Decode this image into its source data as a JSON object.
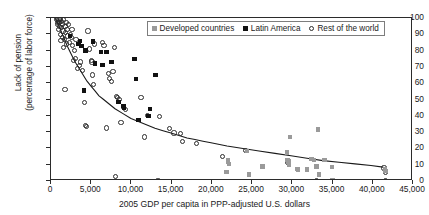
{
  "chart_data": {
    "type": "scatter",
    "title": "",
    "xlabel": "2005 GDP per capita in PPP-adjusted U.S. dollars",
    "ylabel_line1": "Lack of pension",
    "ylabel_line2": "(percentage of labor force)",
    "xlim": [
      0,
      45000
    ],
    "ylim": [
      0,
      100
    ],
    "xticks": [
      0,
      5000,
      10000,
      15000,
      20000,
      25000,
      30000,
      35000,
      40000,
      45000
    ],
    "xtick_labels": [
      "0",
      "5,000",
      "10,000",
      "15,000",
      "20,000",
      "25,000",
      "30,000",
      "35,000",
      "40,000",
      "45,000"
    ],
    "yticks": [
      0,
      10,
      20,
      30,
      40,
      50,
      60,
      70,
      80,
      90,
      100
    ],
    "ytick_labels": [
      "0",
      "10",
      "20",
      "30",
      "40",
      "50",
      "60",
      "70",
      "80",
      "90",
      "100"
    ],
    "grid": false,
    "legend_position": "top-center",
    "colors": {
      "developed": "#9a9a9a",
      "latin_america": "#111111",
      "rest_of_world": "#2b2b2b",
      "trendline": "#1a1a1a",
      "axis": "#2b2b2b"
    },
    "legend": [
      {
        "label": "Developed countries",
        "marker": "filled-square",
        "color": "#9a9a9a"
      },
      {
        "label": "Latin America",
        "marker": "filled-square",
        "color": "#111111"
      },
      {
        "label": "Rest of the world",
        "marker": "open-circle",
        "color": "#2b2b2b"
      }
    ],
    "series": [
      {
        "name": "Rest of the world",
        "marker": "open-circle",
        "points": [
          [
            700,
            99
          ],
          [
            800,
            97
          ],
          [
            850,
            96
          ],
          [
            900,
            98
          ],
          [
            950,
            93
          ],
          [
            1000,
            99
          ],
          [
            1050,
            95
          ],
          [
            1100,
            97
          ],
          [
            1150,
            90
          ],
          [
            1200,
            99
          ],
          [
            1250,
            86
          ],
          [
            1300,
            94
          ],
          [
            1350,
            98
          ],
          [
            1400,
            88
          ],
          [
            1450,
            96
          ],
          [
            1500,
            92
          ],
          [
            1550,
            82
          ],
          [
            1600,
            99
          ],
          [
            1700,
            87
          ],
          [
            1750,
            95
          ],
          [
            1800,
            91
          ],
          [
            1900,
            84
          ],
          [
            1950,
            97
          ],
          [
            2000,
            93
          ],
          [
            2100,
            89
          ],
          [
            2200,
            96
          ],
          [
            2300,
            85
          ],
          [
            2400,
            90
          ],
          [
            2500,
            88
          ],
          [
            2600,
            93
          ],
          [
            1750,
            56
          ],
          [
            2700,
            83
          ],
          [
            2800,
            74
          ],
          [
            2900,
            80
          ],
          [
            3000,
            75
          ],
          [
            3100,
            87
          ],
          [
            3300,
            69
          ],
          [
            3500,
            71
          ],
          [
            3700,
            73
          ],
          [
            3900,
            68
          ],
          [
            4200,
            48
          ],
          [
            4300,
            34
          ],
          [
            4400,
            33.5
          ],
          [
            4600,
            92
          ],
          [
            4800,
            81
          ],
          [
            5000,
            74
          ],
          [
            5100,
            73
          ],
          [
            5200,
            65
          ],
          [
            5300,
            59
          ],
          [
            5400,
            84
          ],
          [
            6400,
            85
          ],
          [
            6600,
            83
          ],
          [
            6900,
            32.5
          ],
          [
            7100,
            66
          ],
          [
            7300,
            63
          ],
          [
            7500,
            61
          ],
          [
            7700,
            67
          ],
          [
            7900,
            82
          ],
          [
            8000,
            3
          ],
          [
            8100,
            52
          ],
          [
            8300,
            51
          ],
          [
            8500,
            50
          ],
          [
            8700,
            36
          ],
          [
            9000,
            45
          ],
          [
            9300,
            44
          ],
          [
            11200,
            51
          ],
          [
            11600,
            27
          ],
          [
            12000,
            40
          ],
          [
            13300,
            0
          ],
          [
            13500,
            39.5
          ],
          [
            14700,
            32
          ],
          [
            15300,
            29.5
          ],
          [
            16100,
            29
          ],
          [
            16300,
            24
          ],
          [
            18100,
            23
          ],
          [
            21300,
            15
          ],
          [
            24200,
            18.5
          ],
          [
            29400,
            11.5
          ],
          [
            33000,
            0
          ],
          [
            41400,
            8
          ],
          [
            41600,
            5
          ],
          [
            41600,
            0.5
          ]
        ]
      },
      {
        "name": "Latin America",
        "marker": "filled-square",
        "points": [
          [
            2400,
            89
          ],
          [
            3400,
            84
          ],
          [
            3600,
            86
          ],
          [
            3800,
            83
          ],
          [
            4100,
            55.5
          ],
          [
            4300,
            80
          ],
          [
            5200,
            85.5
          ],
          [
            5500,
            72
          ],
          [
            6200,
            79
          ],
          [
            6400,
            71
          ],
          [
            6900,
            79
          ],
          [
            7500,
            73
          ],
          [
            8400,
            48.5
          ],
          [
            9000,
            46
          ],
          [
            9100,
            45
          ],
          [
            10400,
            75
          ],
          [
            10600,
            62.5
          ],
          [
            10900,
            37.5
          ],
          [
            12300,
            44
          ],
          [
            13000,
            65
          ],
          [
            12100,
            40
          ]
        ]
      },
      {
        "name": "Developed countries",
        "marker": "filled-square",
        "points": [
          [
            21800,
            5.5
          ],
          [
            22000,
            13
          ],
          [
            22000,
            11.5
          ],
          [
            22100,
            10.5
          ],
          [
            24400,
            18.5
          ],
          [
            24600,
            4
          ],
          [
            26300,
            9
          ],
          [
            29300,
            17.5
          ],
          [
            29400,
            13
          ],
          [
            29500,
            12
          ],
          [
            29600,
            10
          ],
          [
            29700,
            27
          ],
          [
            30600,
            7.5
          ],
          [
            30700,
            7
          ],
          [
            31800,
            7
          ],
          [
            32400,
            13.5
          ],
          [
            32700,
            13
          ],
          [
            33000,
            9
          ],
          [
            33200,
            31.5
          ],
          [
            33300,
            4
          ],
          [
            34000,
            13
          ],
          [
            34900,
            8.5
          ],
          [
            35000,
            0.5
          ],
          [
            41500,
            7.5
          ],
          [
            41600,
            6
          ]
        ]
      }
    ],
    "trendline": {
      "description": "decaying power/exponential fit from ~100% at low GDP to ~8% at 41,500",
      "points": [
        [
          500,
          100
        ],
        [
          1000,
          95
        ],
        [
          1500,
          89
        ],
        [
          2000,
          83
        ],
        [
          2500,
          78
        ],
        [
          3000,
          73
        ],
        [
          3500,
          69
        ],
        [
          4000,
          65
        ],
        [
          4500,
          61
        ],
        [
          5000,
          58
        ],
        [
          5500,
          55
        ],
        [
          6000,
          52
        ],
        [
          6500,
          50
        ],
        [
          7000,
          48
        ],
        [
          7500,
          46
        ],
        [
          8000,
          44
        ],
        [
          9000,
          41
        ],
        [
          10000,
          38
        ],
        [
          11000,
          36
        ],
        [
          12000,
          34
        ],
        [
          13000,
          32
        ],
        [
          14000,
          30.5
        ],
        [
          15000,
          29
        ],
        [
          16000,
          27.5
        ],
        [
          17000,
          26
        ],
        [
          18000,
          25
        ],
        [
          19000,
          24
        ],
        [
          20000,
          23
        ],
        [
          22000,
          21
        ],
        [
          24000,
          19.5
        ],
        [
          26000,
          18
        ],
        [
          28000,
          16.5
        ],
        [
          30000,
          15
        ],
        [
          32000,
          13.5
        ],
        [
          34000,
          12
        ],
        [
          36000,
          11
        ],
        [
          38000,
          10
        ],
        [
          40000,
          9
        ],
        [
          41500,
          8
        ]
      ]
    }
  }
}
